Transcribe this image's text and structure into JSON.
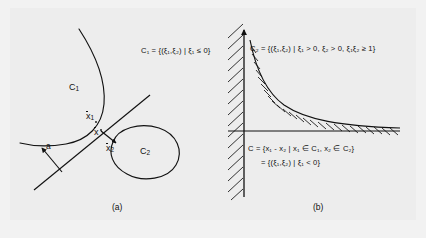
{
  "figure": {
    "background_color": "#f2f2f2",
    "plate_color": "#ededed",
    "ink_color": "#111111",
    "width": 426,
    "height": 238
  },
  "panel_a": {
    "caption": "(a)",
    "set_c1_label": "C",
    "set_c1_sub": "1",
    "set_c2_label": "C",
    "set_c2_sub": "2",
    "point_x1_label": "x",
    "point_x1_sub": "1",
    "point_x_label": "x",
    "point_x2_label": "x",
    "point_x2_sub": "2",
    "normal_vector_label": "a",
    "equation_c1": "C₁ = {(ξ₁,ξ₂) | ξ₁ ≤ 0}",
    "equation_c1_parts": {
      "lhs": "C",
      "lhs_sub": "1",
      "eq": " = {(",
      "xi1": "ξ",
      "xi1_sub": "1",
      "comma": ",",
      "xi2": "ξ",
      "xi2_sub": "2",
      "bar": ") | ",
      "var": "ξ",
      "var_sub": "1",
      "rel": " ≤ 0}"
    }
  },
  "panel_b": {
    "caption": "(b)",
    "equation_c2": "C₂ = {(ξ₁,ξ₂) | ξ₁ > 0, ξ₂ > 0, ξ₁ξ₂ ≥ 1}",
    "equation_c_line1": "C = {x₁ - x₂ | x₁ ∈ C₁, x₂ ∈ C₂}",
    "equation_c_line2": "= {(ξ₁,ξ₂) | ξ₁ < 0}"
  }
}
